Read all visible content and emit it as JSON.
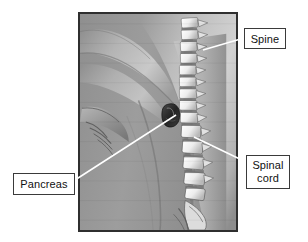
{
  "figure": {
    "background_color": "#ffffff",
    "panel": {
      "name": "anatomy-photo-panel",
      "description": "Greyscale medical illustration: side view of a torso with the arm at the left, the vertebral column running vertically at the right, the spinal cord inside the vertebral canal, and the pancreas shown as a dark organ in front of the spine.",
      "border_color": "#2f2f2f",
      "base_color": "#9a9a9a",
      "bounds": {
        "x": 78,
        "y": 12,
        "width": 160,
        "height": 220
      }
    }
  },
  "callouts": [
    {
      "id": "spine",
      "label": "Spine",
      "box": {
        "x": 244,
        "y": 28,
        "width": 42,
        "height": 21
      },
      "leader_from": {
        "x": 244,
        "y": 38
      },
      "leader_to": {
        "x": 203,
        "y": 50
      },
      "line_color": "#ffffff",
      "border_color": "#3a3a3a"
    },
    {
      "id": "spinal-cord",
      "label": "Spinal\ncord",
      "label_line_1": "Spinal",
      "label_line_2": "cord",
      "box": {
        "x": 246,
        "y": 155,
        "width": 44,
        "height": 34
      },
      "leader_from": {
        "x": 246,
        "y": 162
      },
      "leader_to": {
        "x": 194,
        "y": 137
      },
      "line_color": "#ffffff",
      "border_color": "#3a3a3a"
    },
    {
      "id": "pancreas",
      "label": "Pancreas",
      "box": {
        "x": 13,
        "y": 173,
        "width": 62,
        "height": 22
      },
      "leader_from": {
        "x": 75,
        "y": 180
      },
      "leader_to": {
        "x": 176,
        "y": 115
      },
      "line_color": "#ffffff",
      "border_color": "#3a3a3a"
    }
  ],
  "anatomy": {
    "spine_label": "vertebral column",
    "cord_label": "spinal cord canal",
    "pancreas_marker_color": "#2a2a2a",
    "vertebra_color": "#f2f2f2",
    "disc_color": "#6d6d6d",
    "skin_light": "#c8c8c8",
    "skin_mid": "#a2a2a2",
    "skin_dark": "#7a7a7a"
  }
}
